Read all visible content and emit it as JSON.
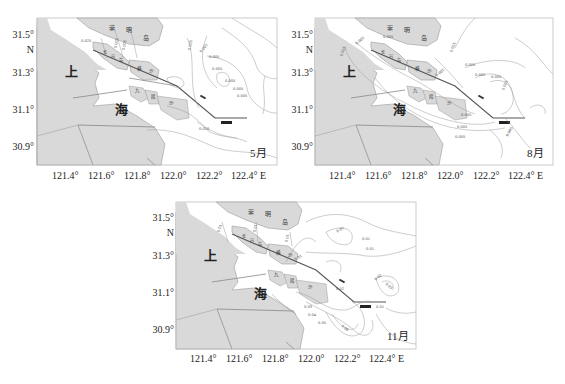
{
  "figure": {
    "panels": [
      {
        "id": "may",
        "month_label": "5月",
        "y_ticks": [
          "31.5°",
          "N",
          "31.3°",
          "31.1°",
          "30.9°"
        ],
        "x_ticks": [
          "121.4°",
          "121.6°",
          "121.8°",
          "122.0°",
          "122.2°",
          "122.4° E"
        ],
        "contour_labels": [
          "0.025",
          "0.005",
          "0.005",
          "0.005",
          "0.005",
          "0.005",
          "0.005",
          "0.005",
          "0.005",
          "0.005",
          "0.010"
        ]
      },
      {
        "id": "aug",
        "month_label": "8月",
        "y_ticks": [
          "31.5°",
          "N",
          "31.3°",
          "31.1°",
          "30.9°"
        ],
        "x_ticks": [
          "121.4°",
          "121.6°",
          "121.8°",
          "122.0°",
          "122.2°",
          "122.4° E"
        ],
        "contour_labels": [
          "0.005",
          "0.005",
          "0.005",
          "0.005",
          "0.005",
          "0.005",
          "0.005",
          "0.005",
          "0.005",
          "0.005",
          "0.005",
          "0.005",
          "0.005"
        ]
      },
      {
        "id": "nov",
        "month_label": "11月",
        "y_ticks": [
          "31.5°",
          "N",
          "31.3°",
          "31.1°",
          "30.9°"
        ],
        "x_ticks": [
          "121.4°",
          "121.6°",
          "121.8°",
          "122.0°",
          "122.2°",
          "122.4° E"
        ],
        "contour_labels": [
          "0.01",
          "0.01",
          "0.02",
          "0.01",
          "0.01",
          "0.01",
          "0.01",
          "0.02",
          "0.03",
          "0.04",
          "0.05",
          "0.06",
          "0.02",
          "0.03",
          "0.01"
        ]
      }
    ],
    "place_labels": {
      "chongming": [
        "崇",
        "明",
        "岛"
      ],
      "shanghai_top": "上",
      "shanghai_bottom": "海",
      "changxing": [
        "长",
        "兴",
        "岛"
      ],
      "hengsha": [
        "横",
        "沙"
      ],
      "jiuduansha": [
        "九",
        "段",
        "沙"
      ]
    },
    "colors": {
      "land": "#d9d9d9",
      "land_edge": "#9a9a9a",
      "contour": "#9a9a9a",
      "channel": "#555555",
      "frame": "#bdbdbd"
    }
  }
}
